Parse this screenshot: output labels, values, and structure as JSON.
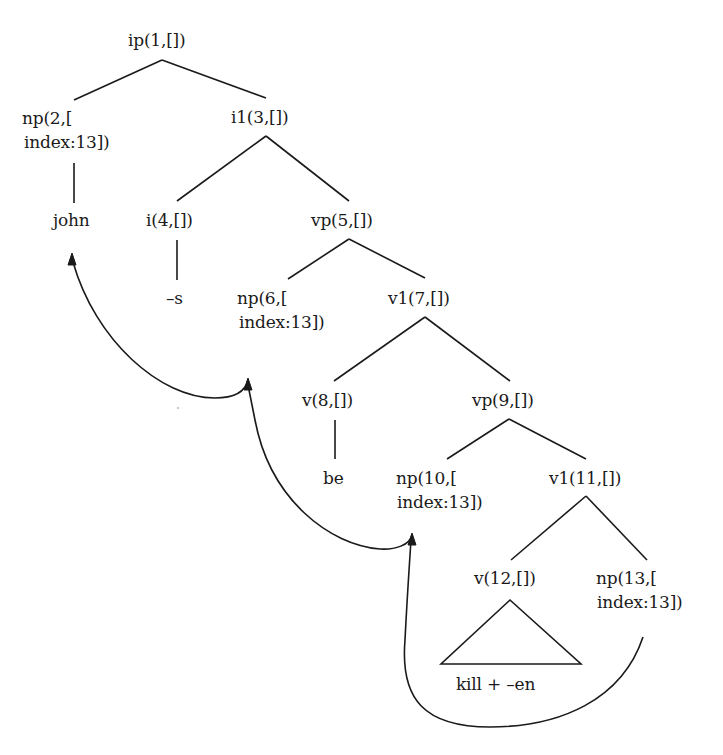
{
  "diagram": {
    "type": "syntax-tree",
    "nodes": [
      {
        "id": 1,
        "label": "ip(1,[])",
        "x": 128,
        "y": 0
      },
      {
        "id": 2,
        "label_line1": "np(2,[",
        "label_line2": "index:13])",
        "x": 22,
        "y": 0
      },
      {
        "id": 3,
        "label": "i1(3,[])"
      },
      {
        "id": 4,
        "label": "i(4,[])"
      },
      {
        "id": 5,
        "label": "vp(5,[])"
      },
      {
        "id": 6,
        "label_line1": "np(6,[",
        "label_line2": "index:13])"
      },
      {
        "id": 7,
        "label": "v1(7,[])"
      },
      {
        "id": 8,
        "label": "v(8,[])"
      },
      {
        "id": 9,
        "label": "vp(9,[])"
      },
      {
        "id": 10,
        "label_line1": "np(10,[",
        "label_line2": "index:13])"
      },
      {
        "id": 11,
        "label": "v1(11,[])"
      },
      {
        "id": 12,
        "label": "v(12,[])"
      },
      {
        "id": 13,
        "label_line1": "np(13,[",
        "label_line2": "index:13])"
      }
    ],
    "leaves": {
      "john": "john",
      "s": "–s",
      "be": "be",
      "kill_en": "kill + –en"
    },
    "edges": [
      [
        "ip(1,[])",
        "np(2,[index:13])"
      ],
      [
        "ip(1,[])",
        "i1(3,[])"
      ],
      [
        "np(2,[index:13])",
        "john"
      ],
      [
        "i1(3,[])",
        "i(4,[])"
      ],
      [
        "i1(3,[])",
        "vp(5,[])"
      ],
      [
        "i(4,[])",
        "–s"
      ],
      [
        "vp(5,[])",
        "np(6,[index:13])"
      ],
      [
        "vp(5,[])",
        "v1(7,[])"
      ],
      [
        "v1(7,[])",
        "v(8,[])"
      ],
      [
        "v1(7,[])",
        "vp(9,[])"
      ],
      [
        "v(8,[])",
        "be"
      ],
      [
        "vp(9,[])",
        "np(10,[index:13])"
      ],
      [
        "vp(9,[])",
        "v1(11,[])"
      ],
      [
        "v1(11,[])",
        "v(12,[])"
      ],
      [
        "v1(11,[])",
        "np(13,[index:13])"
      ],
      [
        "v(12,[])",
        "kill + –en (triangle)"
      ]
    ],
    "movement_arrows": [
      {
        "from": "np(13,[index:13])",
        "to": "np(10,[index:13])"
      },
      {
        "from": "np(10,[index:13])",
        "to": "np(6,[index:13])"
      },
      {
        "from": "np(6,[index:13])",
        "to": "john"
      }
    ]
  },
  "labels": {
    "n1": "ip(1,[])",
    "n2a": "np(2,[",
    "n2b": "index:13])",
    "n3": "i1(3,[])",
    "n4": "i(4,[])",
    "n5": "vp(5,[])",
    "n6a": "np(6,[",
    "n6b": "index:13])",
    "n7": "v1(7,[])",
    "n8": "v(8,[])",
    "n9": "vp(9,[])",
    "n10a": "np(10,[",
    "n10b": "index:13])",
    "n11": "v1(11,[])",
    "n12": "v(12,[])",
    "n13a": "np(13,[",
    "n13b": "index:13])",
    "john": "john",
    "s": "–s",
    "be": "be",
    "kill_en": "kill + –en"
  }
}
